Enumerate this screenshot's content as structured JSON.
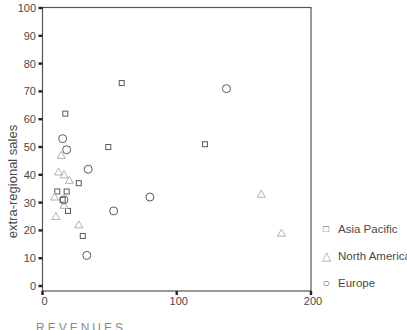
{
  "chart_data": {
    "type": "scatter",
    "title": "",
    "ylabel": "extra-regional sales",
    "xlabel_partial": "REVENUES",
    "xlim": [
      0,
      200
    ],
    "ylim": [
      0,
      100
    ],
    "xticks": [
      0,
      100,
      200
    ],
    "yticks": [
      0,
      10,
      20,
      30,
      40,
      50,
      60,
      70,
      80,
      90,
      100
    ],
    "grid": false,
    "legend_position": "right-bottom",
    "frame_color": "#555555",
    "tick_color": "#222222",
    "text_color": "#4a4a4a",
    "series": [
      {
        "name": "Asia Pacific",
        "marker": "square",
        "glyph": "□",
        "color": "#5a5a5a",
        "points": [
          [
            17,
            62
          ],
          [
            59,
            73
          ],
          [
            49,
            50
          ],
          [
            121,
            51
          ],
          [
            27,
            37
          ],
          [
            18,
            34
          ],
          [
            11,
            34
          ],
          [
            15,
            31
          ],
          [
            19,
            27
          ],
          [
            30,
            18
          ]
        ]
      },
      {
        "name": "North America",
        "marker": "triangle",
        "glyph": "△",
        "color": "#b0b0b0",
        "points": [
          [
            14,
            47
          ],
          [
            12,
            41
          ],
          [
            16,
            40
          ],
          [
            20,
            38
          ],
          [
            9,
            32
          ],
          [
            16,
            29
          ],
          [
            10,
            25
          ],
          [
            27,
            22
          ],
          [
            163,
            33
          ],
          [
            178,
            19
          ]
        ]
      },
      {
        "name": "Europe",
        "marker": "circle",
        "glyph": "○",
        "color": "#5a5a5a",
        "points": [
          [
            15,
            53
          ],
          [
            18,
            49
          ],
          [
            34,
            42
          ],
          [
            16,
            31
          ],
          [
            80,
            32
          ],
          [
            53,
            27
          ],
          [
            33,
            11
          ],
          [
            137,
            71
          ]
        ]
      }
    ]
  }
}
